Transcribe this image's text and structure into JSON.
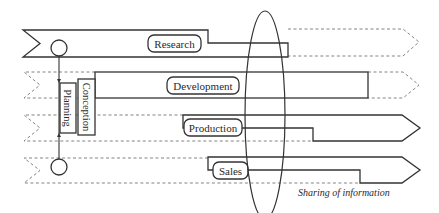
{
  "diagram": {
    "lanes": [
      {
        "id": "research",
        "label": "Research"
      },
      {
        "id": "development",
        "label": "Development"
      },
      {
        "id": "production",
        "label": "Production"
      },
      {
        "id": "sales",
        "label": "Sales"
      }
    ],
    "vertical_boxes": [
      {
        "id": "planning",
        "label": "Planning"
      },
      {
        "id": "conception",
        "label": "Conception"
      }
    ],
    "ellipse_caption": "Sharing of information",
    "colors": {
      "stroke": "#333333",
      "dashed": "#777777",
      "background": "#ffffff"
    }
  }
}
